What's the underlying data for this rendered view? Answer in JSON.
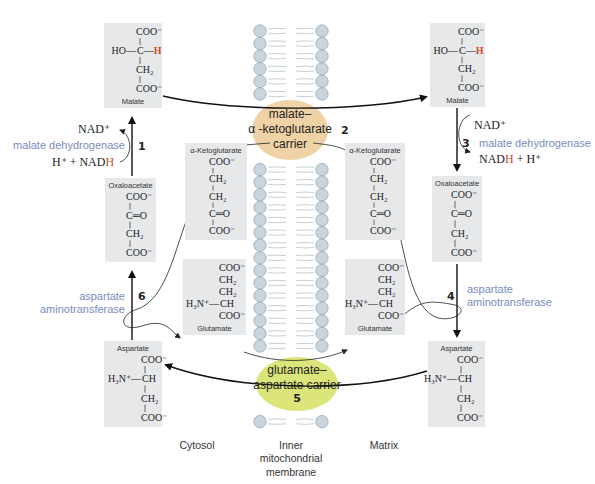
{
  "regions": {
    "cytosol": "Cytosol",
    "membrane": [
      "Inner",
      "mitochondrial",
      "membrane"
    ],
    "matrix": "Matrix"
  },
  "carriers": {
    "mk": {
      "lines": [
        "malate–",
        "α -ketoglutarate",
        "carrier"
      ],
      "step": "2",
      "color": "#efd3a6"
    },
    "ga": {
      "lines": [
        "glutamate–",
        "aspartate carrier"
      ],
      "step": "5",
      "color": "#dbe57a"
    }
  },
  "molecules": {
    "malate_cyt": {
      "name": "Malate",
      "rows": [
        "COO⁻",
        "HO—C—H",
        "CH₂",
        "COO⁻"
      ]
    },
    "malate_mat": {
      "name": "Malate",
      "rows": [
        "COO⁻",
        "HO—C—H",
        "CH₂",
        "COO⁻"
      ]
    },
    "oaa_cyt": {
      "name": "Oxaloacetate",
      "rows": [
        "COO⁻",
        "C═O",
        "CH₂",
        "COO⁻"
      ]
    },
    "oaa_mat": {
      "name": "Oxaloacetate",
      "rows": [
        "COO⁻",
        "C═O",
        "CH₂",
        "COO⁻"
      ]
    },
    "akg_cyt": {
      "name": "α-Ketoglutarate",
      "rows": [
        "COO⁻",
        "CH₂",
        "CH₂",
        "C═O",
        "COO⁻"
      ]
    },
    "akg_mat": {
      "name": "α-Ketoglutarate",
      "rows": [
        "COO⁻",
        "CH₂",
        "CH₂",
        "C═O",
        "COO⁻"
      ]
    },
    "glu_cyt": {
      "name": "Glutamate",
      "rows": [
        "COO⁻",
        "CH₂",
        "CH₂",
        "H₃N⁺—CH",
        "COO⁻"
      ]
    },
    "glu_mat": {
      "name": "Glutamate",
      "rows": [
        "COO⁻",
        "CH₂",
        "CH₂",
        "H₃N⁺—CH",
        "COO⁻"
      ]
    },
    "asp_cyt": {
      "name": "Aspartate",
      "rows": [
        "COO⁻",
        "H₃N⁺—CH",
        "CH₂",
        "COO⁻"
      ]
    },
    "asp_mat": {
      "name": "Aspartate",
      "rows": [
        "COO⁻",
        "H₃N⁺—CH",
        "CH₂",
        "COO⁻"
      ]
    }
  },
  "reactions": {
    "r1": {
      "step": "1",
      "enzyme": "malate dehydrogenase",
      "top": "NAD⁺",
      "bottom_pre": "H⁺ + NAD",
      "bottom_h": "H"
    },
    "r3": {
      "step": "3",
      "enzyme": "malate dehydrogenase",
      "top": "NAD⁺",
      "bottom_pre": "NAD",
      "bottom_h": "H",
      "bottom_post": " + H⁺"
    },
    "r4": {
      "step": "4",
      "enzyme_lines": [
        "aspartate",
        "aminotransferase"
      ]
    },
    "r6": {
      "step": "6",
      "enzyme_lines": [
        "aspartate",
        "aminotransferase"
      ]
    }
  },
  "colors": {
    "enzyme_text": "#7a8cbf",
    "highlight_h": "#d24a2a",
    "molecule_box": "#e6e8ea",
    "membrane_bead": "#c9d4dc"
  }
}
